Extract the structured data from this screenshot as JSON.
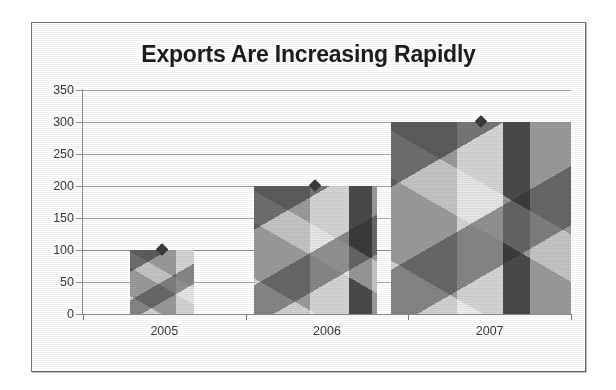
{
  "chart_data": {
    "type": "bar",
    "title": "Exports Are Increasing Rapidly",
    "xlabel": "",
    "ylabel": "",
    "categories": [
      "2005",
      "2006",
      "2007"
    ],
    "values": [
      100,
      200,
      300
    ],
    "series": [
      {
        "name": "Exports",
        "values": [
          100,
          200,
          300
        ]
      }
    ],
    "ylim": [
      0,
      350
    ],
    "ytick_step": 50,
    "ytick_labels": [
      "0",
      "50",
      "100",
      "150",
      "200",
      "250",
      "300",
      "350"
    ],
    "ytick_values": [
      0,
      50,
      100,
      150,
      200,
      250,
      300,
      350
    ],
    "grid": true,
    "grid_axis": "y",
    "legend": false,
    "legend_position": "none",
    "bar_fill": "grayscale isometric cube photo texture",
    "colors": {
      "frame_border": "#6e6e6e",
      "title_text": "#1d1d1d",
      "tick_text": "#3a3a3a",
      "gridline": "#a8a8a8",
      "axis_line": "#6f6f6f",
      "bar_light": "#d4d4d4",
      "bar_mid": "#9a9a9a",
      "bar_dark": "#4a4a4a",
      "plot_background": "#ffffff"
    },
    "bar_geometry": [
      {
        "category": "2005",
        "left_pct": 9.6,
        "width_pct": 13.1,
        "value": 100
      },
      {
        "category": "2006",
        "left_pct": 35.0,
        "width_pct": 25.2,
        "value": 200
      },
      {
        "category": "2007",
        "left_pct": 63.1,
        "width_pct": 36.9,
        "value": 300
      }
    ]
  }
}
